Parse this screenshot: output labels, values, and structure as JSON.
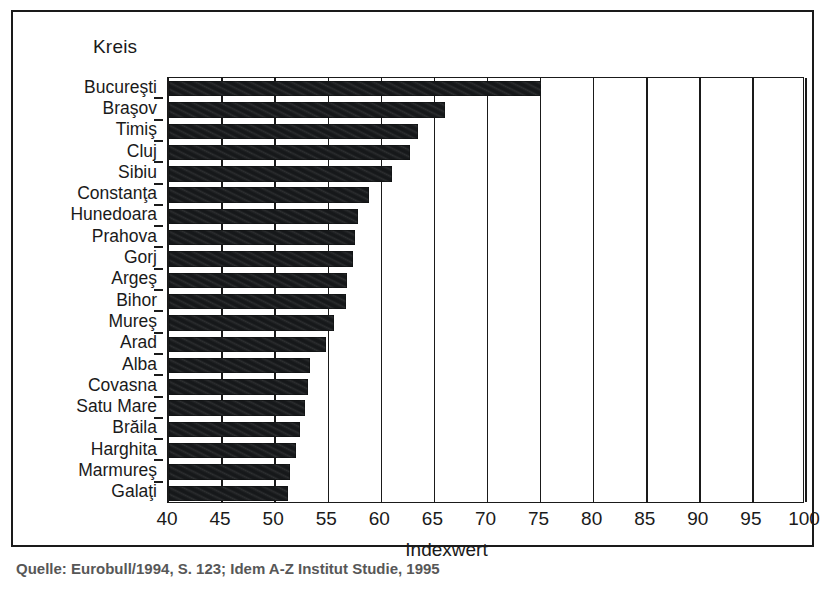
{
  "figure": {
    "y_axis_caption": "Kreis",
    "x_axis_title": "Indexwert",
    "source_caption": "Quelle: Eurobull/1994, S. 123; Idem A-Z Institut Studie, 1995"
  },
  "chart_data": {
    "type": "bar",
    "orientation": "horizontal",
    "title": "",
    "subtitle": "",
    "xlabel": "Indexwert",
    "ylabel": "Kreis",
    "xlim": [
      40,
      100
    ],
    "ylim": null,
    "grid": true,
    "legend": false,
    "legend_position": "none",
    "xticks": [
      40,
      45,
      50,
      55,
      60,
      65,
      70,
      75,
      80,
      85,
      90,
      95,
      100
    ],
    "xticklabels": [
      "40",
      "45",
      "50",
      "55",
      "60",
      "65",
      "70",
      "75",
      "80",
      "85",
      "90",
      "95",
      "100"
    ],
    "categories": [
      "Bucureşti",
      "Braşov",
      "Timiş",
      "Cluj",
      "Sibiu",
      "Constanţa",
      "Hunedoara",
      "Prahova",
      "Gorj",
      "Argeş",
      "Bihor",
      "Mureş",
      "Arad",
      "Alba",
      "Covasna",
      "Satu Mare",
      "Brăila",
      "Harghita",
      "Marmureş",
      "Galaţi"
    ],
    "values": [
      75.0,
      66.0,
      63.5,
      62.7,
      61.0,
      58.8,
      57.8,
      57.5,
      57.3,
      56.8,
      56.7,
      55.5,
      54.8,
      53.3,
      53.1,
      52.8,
      52.3,
      52.0,
      51.4,
      51.2
    ],
    "series": [
      {
        "name": "Indexwert",
        "color": "#16181a",
        "values": [
          75.0,
          66.0,
          63.5,
          62.7,
          61.0,
          58.8,
          57.8,
          57.5,
          57.3,
          56.8,
          56.7,
          55.5,
          54.8,
          53.3,
          53.1,
          52.8,
          52.3,
          52.0,
          51.4,
          51.2
        ]
      }
    ],
    "bar_color": "#16181a",
    "background_color": "#ffffff",
    "axis_color": "#1a1a1a"
  }
}
